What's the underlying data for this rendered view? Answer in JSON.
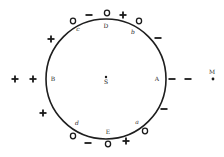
{
  "diagram": {
    "circle": {
      "cx": 106,
      "cy": 79,
      "r": 60,
      "stroke": "#1e1e1e"
    },
    "center_point": {
      "x": 106,
      "y": 77,
      "label": "S"
    },
    "external_point": {
      "x": 213,
      "y": 79,
      "label": "M"
    },
    "point_labels": [
      {
        "id": "A",
        "text": "A",
        "x": 157,
        "y": 81,
        "italic": false
      },
      {
        "id": "B",
        "text": "B",
        "x": 53,
        "y": 81,
        "italic": false
      },
      {
        "id": "D",
        "text": "D",
        "x": 106,
        "y": 28,
        "italic": false
      },
      {
        "id": "E",
        "text": "E",
        "x": 108,
        "y": 134,
        "italic": false
      },
      {
        "id": "a",
        "text": "a",
        "x": 137,
        "y": 124,
        "italic": true
      },
      {
        "id": "b",
        "text": "b",
        "x": 133,
        "y": 34,
        "italic": true
      },
      {
        "id": "c",
        "text": "c",
        "x": 78,
        "y": 31,
        "italic": true
      },
      {
        "id": "d",
        "text": "d",
        "x": 77,
        "y": 125,
        "italic": true
      }
    ],
    "charges": [
      {
        "sign": "O",
        "x": 73,
        "y": 21
      },
      {
        "sign": "−",
        "x": 89,
        "y": 15
      },
      {
        "sign": "O",
        "x": 107,
        "y": 13
      },
      {
        "sign": "+",
        "x": 123,
        "y": 15
      },
      {
        "sign": "O",
        "x": 139,
        "y": 21
      },
      {
        "sign": "−",
        "x": 158,
        "y": 38
      },
      {
        "sign": "+",
        "x": 51,
        "y": 39
      },
      {
        "sign": "+",
        "x": 15,
        "y": 79
      },
      {
        "sign": "+",
        "x": 33,
        "y": 79
      },
      {
        "sign": "−",
        "x": 172,
        "y": 79
      },
      {
        "sign": "−",
        "x": 188,
        "y": 79
      },
      {
        "sign": "−",
        "x": 164,
        "y": 109
      },
      {
        "sign": "+",
        "x": 43,
        "y": 113
      },
      {
        "sign": "O",
        "x": 73,
        "y": 136
      },
      {
        "sign": "−",
        "x": 88,
        "y": 143
      },
      {
        "sign": "O",
        "x": 108,
        "y": 144
      },
      {
        "sign": "+",
        "x": 126,
        "y": 141
      },
      {
        "sign": "O",
        "x": 145,
        "y": 131
      }
    ]
  }
}
